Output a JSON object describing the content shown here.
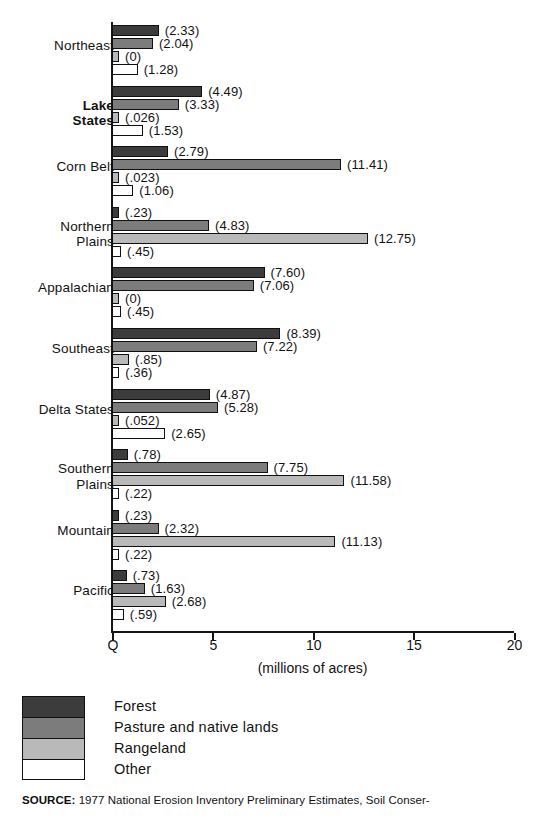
{
  "chart_data": {
    "type": "bar",
    "orientation": "horizontal",
    "title": "",
    "subtitle": "",
    "xlabel": "(millions of acres)",
    "ylabel": "",
    "xlim": [
      0,
      20
    ],
    "xticks": [
      0,
      5,
      10,
      15,
      20
    ],
    "xtick_labels": [
      "Q",
      "5",
      "10",
      "15",
      "20"
    ],
    "grid": false,
    "legend_position": "below-plot",
    "units": "millions of acres",
    "categories": [
      "Northeast",
      "Lake States",
      "Corn Belt",
      "Northern Plains",
      "Appalachian",
      "Southeast",
      "Delta States",
      "Southern Plains",
      "Mountain",
      "Pacific"
    ],
    "series": [
      {
        "name": "Forest",
        "color": "#3c3c3c",
        "values": [
          2.33,
          4.49,
          2.79,
          0.23,
          7.6,
          8.39,
          4.87,
          0.78,
          0.23,
          0.73
        ],
        "labels": [
          "(2.33)",
          "(4.49)",
          "(2.79)",
          "(.23)",
          "(7.60)",
          "(8.39)",
          "(4.87)",
          "(.78)",
          "(.23)",
          "(.73)"
        ]
      },
      {
        "name": "Pasture and native lands",
        "color": "#7c7c7c",
        "values": [
          2.04,
          3.33,
          11.41,
          4.83,
          7.06,
          7.22,
          5.28,
          7.75,
          2.32,
          1.63
        ],
        "labels": [
          "(2.04)",
          "(3.33)",
          "(11.41)",
          "(4.83)",
          "(7.06)",
          "(7.22)",
          "(5.28)",
          "(7.75)",
          "(2.32)",
          "(1.63)"
        ]
      },
      {
        "name": "Rangeland",
        "color": "#b9b9b9",
        "values": [
          0,
          0.026,
          0.023,
          12.75,
          0,
          0.85,
          0.052,
          11.58,
          11.13,
          2.68
        ],
        "labels": [
          "(0)",
          "(.026)",
          "(.023)",
          "(12.75)",
          "(0)",
          "(.85)",
          "(.052)",
          "(11.58)",
          "(11.13)",
          "(2.68)"
        ]
      },
      {
        "name": "Other",
        "color": "#ffffff",
        "values": [
          1.28,
          1.53,
          1.06,
          0.45,
          0.45,
          0.36,
          2.65,
          0.22,
          0.22,
          0.59
        ],
        "labels": [
          "(1.28)",
          "(1.53)",
          "(1.06)",
          "(.45)",
          "(.45)",
          "(.36)",
          "(2.65)",
          "(.22)",
          "(.22)",
          "(.59)"
        ]
      }
    ]
  },
  "axis": {
    "title": "(millions of acres)",
    "tick_labels": [
      "Q",
      "5",
      "10",
      "15",
      "20"
    ]
  },
  "legend": {
    "items": [
      {
        "label": "Forest",
        "key": "forest"
      },
      {
        "label": "Pasture and native lands",
        "key": "pasture"
      },
      {
        "label": "Rangeland",
        "key": "rangeland"
      },
      {
        "label": "Other",
        "key": "other"
      }
    ]
  },
  "source": {
    "prefix": "SOURCE:",
    "text": "1977 National Erosion Inventory Preliminary Estimates, Soil Conser-"
  }
}
